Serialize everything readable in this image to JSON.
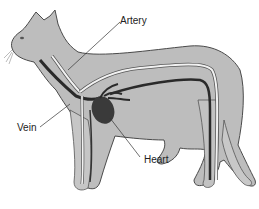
{
  "diagram": {
    "labels": {
      "artery": "Artery",
      "vein": "Vein",
      "heart": "Heart"
    },
    "colors": {
      "body": "#b9b9b9",
      "outline": "#555555",
      "artery": "#f2f2f2",
      "vein": "#2a2a2a",
      "heart": "#3a3a3a"
    }
  }
}
